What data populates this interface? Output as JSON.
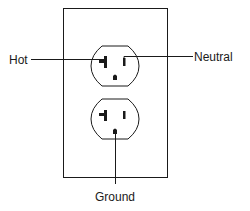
{
  "diagram": {
    "type": "electrical-outlet-diagram",
    "labels": {
      "hot": "Hot",
      "neutral": "Neutral",
      "ground": "Ground"
    },
    "components": [
      {
        "name": "wall-plate"
      },
      {
        "name": "upper-receptacle",
        "slots": [
          "hot-slot",
          "neutral-slot",
          "ground-hole"
        ]
      },
      {
        "name": "lower-receptacle",
        "slots": [
          "hot-slot",
          "neutral-slot",
          "ground-hole"
        ]
      }
    ],
    "colors": {
      "stroke": "#1a1a1a",
      "background": "#ffffff"
    }
  }
}
